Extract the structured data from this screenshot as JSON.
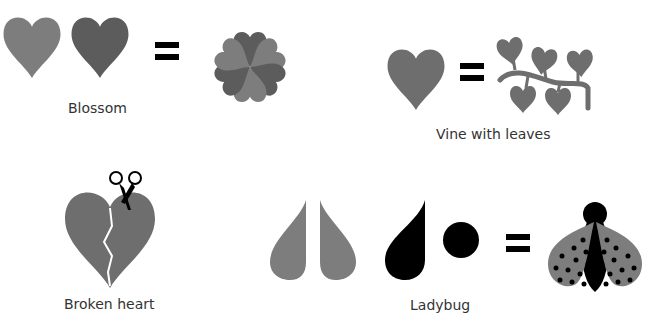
{
  "colors": {
    "heart_light": "#7d7d7d",
    "heart_dark": "#5c5c5c",
    "heart_mid": "#6e6e6e",
    "black": "#000000",
    "label": "#333333"
  },
  "sections": {
    "blossom": {
      "label": "Blossom",
      "equation": [
        "heart",
        "heart",
        "=",
        "blossom"
      ]
    },
    "vine": {
      "label": "Vine with leaves",
      "equation": [
        "heart",
        "=",
        "vine"
      ]
    },
    "broken_heart": {
      "label": "Broken heart",
      "elements": [
        "heart",
        "scissors",
        "crack"
      ]
    },
    "ladybug": {
      "label": "Ladybug",
      "equation": [
        "teardrop",
        "teardrop",
        "black-teardrop",
        "circle",
        "=",
        "ladybug"
      ]
    }
  }
}
